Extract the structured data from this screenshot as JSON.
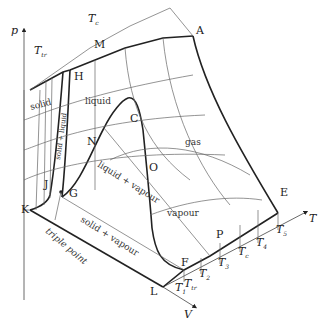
{
  "axes": {
    "p": "p",
    "V": "V",
    "T": "T"
  },
  "points": {
    "A": "A",
    "M": "M",
    "H": "H",
    "C": "C",
    "N": "N",
    "O": "O",
    "J": "J",
    "G": "G",
    "K": "K",
    "L": "L",
    "F": "F",
    "P": "P",
    "E": "E"
  },
  "regions": {
    "solid": "solid",
    "liquid": "liquid",
    "gas": "gas",
    "vapour": "vapour",
    "solid_liquid": "solid + liquid",
    "liquid_vapour": "liquid + vapour",
    "solid_vapour": "solid + vapour",
    "triple_point": "triple point"
  },
  "temperatures": {
    "Tc_top": "T",
    "Tc_top_sub": "c",
    "Ttr_top": "T",
    "Ttr_top_sub": "tr",
    "T1": "T",
    "T1_sub": "1",
    "Ttr": "T",
    "Ttr_sub": "tr",
    "T2": "T",
    "T2_sub": "2",
    "T3": "T",
    "T3_sub": "3",
    "Tc": "T",
    "Tc_sub": "c",
    "T4": "T",
    "T4_sub": "4",
    "T5": "T",
    "T5_sub": "5"
  }
}
